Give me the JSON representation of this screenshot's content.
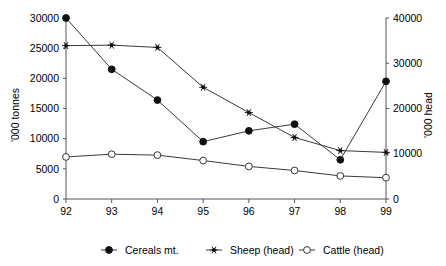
{
  "chart_data": {
    "type": "line",
    "title": "",
    "x": [
      "92",
      "93",
      "94",
      "95",
      "96",
      "97",
      "98",
      "99"
    ],
    "xlabel": "",
    "grid": false,
    "legend_position": "bottom",
    "axes": {
      "left": {
        "label": "'000 tonnes",
        "ticks": [
          "0",
          "5000",
          "10000",
          "15000",
          "20000",
          "25000",
          "30000"
        ],
        "min": 0,
        "max": 30000,
        "step": 5000
      },
      "right": {
        "label": "'000 head",
        "ticks": [
          "0",
          "10000",
          "20000",
          "30000",
          "40000"
        ],
        "min": 0,
        "max": 40000,
        "step": 10000
      }
    },
    "series": [
      {
        "name": "Cereals mt.",
        "axis": "left",
        "marker": "filled-circle",
        "values": [
          30000,
          21500,
          16400,
          9500,
          11300,
          12400,
          6500,
          19500
        ]
      },
      {
        "name": "Sheep (head)",
        "axis": "right",
        "marker": "star",
        "values": [
          33900,
          34000,
          33500,
          24700,
          19100,
          13600,
          10700,
          10300
        ]
      },
      {
        "name": "Cattle (head)",
        "axis": "right",
        "marker": "open-circle",
        "values": [
          9300,
          9900,
          9700,
          8500,
          7200,
          6300,
          5100,
          4700
        ]
      }
    ]
  },
  "legend": {
    "items": [
      {
        "label": "Cereals mt.",
        "marker": "filled-circle"
      },
      {
        "label": "Sheep (head)",
        "marker": "star"
      },
      {
        "label": "Cattle (head)",
        "marker": "open-circle"
      }
    ]
  },
  "colors": {
    "background": "#ffffff",
    "axis": "#555555",
    "line": "#3a3a3a",
    "marker_fill": "#111111",
    "marker_open_fill": "#ffffff",
    "text": "#000000"
  }
}
